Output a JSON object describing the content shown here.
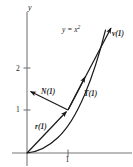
{
  "figure": {
    "background_color": "#ffffff",
    "ink_color": "#1a1a1a",
    "axis_color": "#77777a",
    "axes": {
      "y_axis_label": "y",
      "x_axis_label": "",
      "x_ticks": [
        {
          "label": "1",
          "value": 1
        }
      ],
      "y_ticks": [
        {
          "label": "1",
          "value": 1
        },
        {
          "label": "2",
          "value": 2
        }
      ],
      "origin_px": {
        "x": 27,
        "y": 153
      },
      "unit_px": {
        "x": 41,
        "y": 43
      },
      "xlim": [
        -0.15,
        2.6
      ],
      "ylim": [
        -0.12,
        3.4
      ]
    },
    "curve": {
      "equation_label": "y = x",
      "equation_exponent": "2",
      "type": "parabola",
      "points": [
        {
          "x": 0.0,
          "y": 0.0
        },
        {
          "x": 0.25,
          "y": 0.0625
        },
        {
          "x": 0.5,
          "y": 0.25
        },
        {
          "x": 0.75,
          "y": 0.5625
        },
        {
          "x": 1.0,
          "y": 1.0
        },
        {
          "x": 1.25,
          "y": 1.5625
        },
        {
          "x": 1.5,
          "y": 2.25
        },
        {
          "x": 1.7,
          "y": 2.89
        },
        {
          "x": 1.78,
          "y": 3.17
        }
      ]
    },
    "point_of_interest": {
      "x": 1,
      "y": 1
    },
    "vectors": [
      {
        "name": "r",
        "label": "r(1)",
        "description": "position vector from origin to (1,1)",
        "tail": {
          "x": 0,
          "y": 0
        },
        "head": {
          "x": 1,
          "y": 1
        }
      },
      {
        "name": "v",
        "label": "v(1)",
        "description": "velocity vector at t = 1",
        "tail": {
          "x": 1,
          "y": 1
        },
        "head": {
          "x": 2.1,
          "y": 3.25
        }
      },
      {
        "name": "T",
        "label": "T(1)",
        "description": "unit tangent vector at t = 1",
        "tail": {
          "x": 1,
          "y": 1
        },
        "head": {
          "x": 1.45,
          "y": 1.9
        }
      },
      {
        "name": "N",
        "label": "N(1)",
        "description": "unit normal vector at t = 1",
        "tail": {
          "x": 1,
          "y": 1
        },
        "head": {
          "x": 0.06,
          "y": 1.48
        }
      }
    ]
  }
}
